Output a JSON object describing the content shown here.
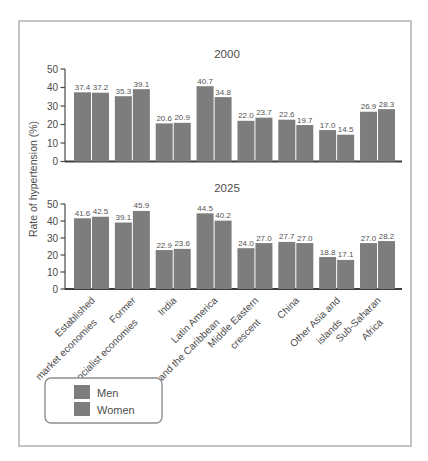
{
  "chart_data": [
    {
      "type": "bar",
      "title": "2000",
      "categories": [
        "Established\nmarket economies",
        "Former\nsocialist economies",
        "India",
        "Latin America\nand the Caribbean",
        "Middle Eastern\ncrescent",
        "China",
        "Other Asia and\nislands",
        "Sub-Saharan\nAfrica"
      ],
      "series": [
        {
          "name": "Men",
          "color": "#7d7d7d",
          "values": [
            37.4,
            35.3,
            20.6,
            40.7,
            22.0,
            22.6,
            17.0,
            26.9
          ]
        },
        {
          "name": "Women",
          "color": "#7d7d7d",
          "values": [
            37.2,
            39.1,
            20.9,
            34.8,
            23.7,
            19.7,
            14.5,
            28.3
          ]
        }
      ],
      "xlabel": "",
      "ylabel": "Rate of hypertension (%)",
      "ylim": [
        0,
        50
      ],
      "yticks": [
        0,
        10,
        20,
        30,
        40,
        50
      ],
      "show_x_labels": false,
      "grid": false
    },
    {
      "type": "bar",
      "title": "2025",
      "categories": [
        "Established\nmarket economies",
        "Former\nsocialist economies",
        "India",
        "Latin America\nand the Caribbean",
        "Middle Eastern\ncrescent",
        "China",
        "Other Asia and\nislands",
        "Sub-Saharan\nAfrica"
      ],
      "series": [
        {
          "name": "Men",
          "color": "#7d7d7d",
          "values": [
            41.6,
            39.1,
            22.9,
            44.5,
            24.0,
            27.7,
            18.8,
            27.0
          ]
        },
        {
          "name": "Women",
          "color": "#7d7d7d",
          "values": [
            42.5,
            45.9,
            23.6,
            40.2,
            27.0,
            27.0,
            17.1,
            28.2
          ]
        }
      ],
      "xlabel": "",
      "ylabel": "Rate of hypertension (%)",
      "ylim": [
        0,
        50
      ],
      "yticks": [
        0,
        10,
        20,
        30,
        40,
        50
      ],
      "show_x_labels": true,
      "grid": false
    }
  ],
  "legend": {
    "position": "bottom-left",
    "items": [
      {
        "label": "Men",
        "color": "#7d7d7d"
      },
      {
        "label": "Women",
        "color": "#7d7d7d"
      }
    ]
  },
  "colors": {
    "bar": "#7d7d7d",
    "axis": "#4a4a4a",
    "text": "#4d4d4d",
    "figure_border": "#c4c4c4"
  }
}
